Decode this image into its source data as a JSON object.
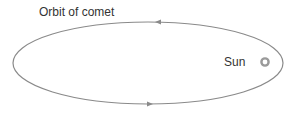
{
  "diagram": {
    "title": "Orbit of comet",
    "sun_label": "Sun",
    "colors": {
      "orbit": "#8a8a8a",
      "sun_ring": "#9a9a9a",
      "text": "#333333"
    },
    "orbit": {
      "cx": 148,
      "cy": 63,
      "rx": 135,
      "ry": 41
    },
    "arrows": [
      {
        "position": "top",
        "direction": "left"
      },
      {
        "position": "bottom",
        "direction": "right"
      }
    ],
    "sun": {
      "cx": 265,
      "cy": 62
    }
  }
}
